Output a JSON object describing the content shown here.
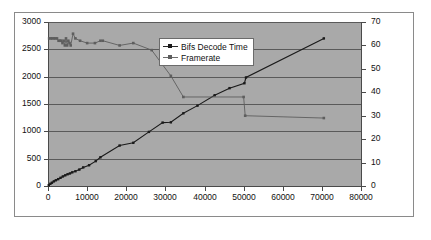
{
  "chart_data": {
    "type": "line",
    "title": "",
    "xlabel": "",
    "ylabel": "",
    "y2label": "",
    "grid": true,
    "legend_position": "inside-top-center",
    "xlim": [
      0,
      80000
    ],
    "ylim": [
      0,
      3000
    ],
    "y2lim": [
      0,
      70
    ],
    "xticks": [
      0,
      10000,
      20000,
      30000,
      40000,
      50000,
      60000,
      70000,
      80000
    ],
    "xtick_labels": [
      "0",
      "10000",
      "20000",
      "30000",
      "40000",
      "50000",
      "60000",
      "70000",
      "80000"
    ],
    "yticks": [
      0,
      500,
      1000,
      1500,
      2000,
      2500,
      3000
    ],
    "ytick_labels": [
      "0",
      "500",
      "1000",
      "1500",
      "2000",
      "2500",
      "3000"
    ],
    "y2ticks": [
      0,
      10,
      20,
      30,
      40,
      50,
      60,
      70
    ],
    "y2tick_labels": [
      "0",
      "10",
      "20",
      "30",
      "40",
      "50",
      "60",
      "70"
    ],
    "series": [
      {
        "name": "Bifs Decode Time",
        "axis": "left",
        "color": "#1a1a1a",
        "points": [
          [
            200,
            15
          ],
          [
            600,
            40
          ],
          [
            1000,
            60
          ],
          [
            1500,
            85
          ],
          [
            2000,
            105
          ],
          [
            2600,
            125
          ],
          [
            3200,
            150
          ],
          [
            3800,
            175
          ],
          [
            4400,
            195
          ],
          [
            5000,
            215
          ],
          [
            5600,
            230
          ],
          [
            6200,
            250
          ],
          [
            7000,
            270
          ],
          [
            8000,
            300
          ],
          [
            9000,
            340
          ],
          [
            10500,
            380
          ],
          [
            12200,
            455
          ],
          [
            13400,
            525
          ],
          [
            18300,
            740
          ],
          [
            21800,
            790
          ],
          [
            25800,
            990
          ],
          [
            29300,
            1160
          ],
          [
            31400,
            1165
          ],
          [
            34600,
            1330
          ],
          [
            38200,
            1470
          ],
          [
            42600,
            1660
          ],
          [
            46400,
            1790
          ],
          [
            50200,
            1880
          ],
          [
            50600,
            1985
          ],
          [
            70500,
            2700
          ]
        ]
      },
      {
        "name": "Framerate",
        "axis": "right",
        "color": "#5e5e5e",
        "points": [
          [
            300,
            63
          ],
          [
            700,
            63
          ],
          [
            1100,
            63
          ],
          [
            1500,
            63
          ],
          [
            1900,
            63
          ],
          [
            2300,
            63
          ],
          [
            2700,
            62
          ],
          [
            3100,
            62
          ],
          [
            3400,
            62
          ],
          [
            3700,
            61
          ],
          [
            4000,
            62
          ],
          [
            4300,
            60
          ],
          [
            4600,
            63
          ],
          [
            4900,
            60
          ],
          [
            5200,
            62
          ],
          [
            5500,
            61
          ],
          [
            5800,
            60
          ],
          [
            6400,
            65
          ],
          [
            7000,
            63
          ],
          [
            8200,
            62
          ],
          [
            10000,
            61
          ],
          [
            12000,
            61
          ],
          [
            13400,
            62
          ],
          [
            14000,
            62
          ],
          [
            18300,
            60
          ],
          [
            21800,
            61
          ],
          [
            26500,
            58
          ],
          [
            31400,
            47
          ],
          [
            34600,
            38
          ],
          [
            50000,
            38
          ],
          [
            50400,
            30
          ],
          [
            70500,
            29
          ]
        ]
      }
    ]
  },
  "legend": {
    "entries": [
      {
        "label": "Bifs Decode Time",
        "marker": "line-dot"
      },
      {
        "label": "Framerate",
        "marker": "line-dot"
      }
    ]
  },
  "colors": {
    "plot_background": "#a9a9a9",
    "frame_background": "#ffffff",
    "gridline": "#5a5a5a",
    "series_1": "#1a1a1a",
    "series_2": "#5e5e5e",
    "text": "#111111"
  }
}
